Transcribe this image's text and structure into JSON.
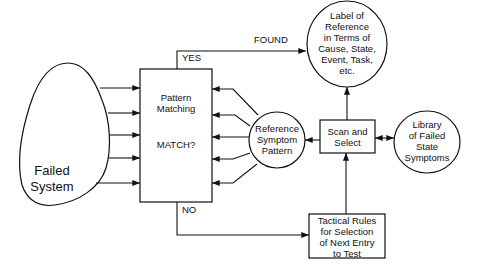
{
  "diagram": {
    "nodes": {
      "failed_system": {
        "label": "Failed\nSystem",
        "shape": "blob"
      },
      "pattern_matching": {
        "title": "Pattern\nMatching",
        "question": "MATCH?",
        "shape": "rectangle"
      },
      "label_of_reference": {
        "label": "Label of\nReference\nin Terms of\nCause, State,\nEvent, Task,\netc.",
        "shape": "circle"
      },
      "reference_symptom_pattern": {
        "label": "Reference\nSymptom\nPattern",
        "shape": "circle"
      },
      "scan_and_select": {
        "label": "Scan and\nSelect",
        "shape": "rectangle"
      },
      "library": {
        "label": "Library\nof Failed\nState\nSymptoms",
        "shape": "circle"
      },
      "tactical_rules": {
        "label": "Tactical Rules\nfor Selection\nof Next Entry\nto Test",
        "shape": "rectangle"
      }
    },
    "edges": {
      "yes": {
        "label": "YES",
        "from": "pattern_matching",
        "to": "label_of_reference"
      },
      "found": {
        "label": "FOUND"
      },
      "no": {
        "label": "NO",
        "from": "pattern_matching",
        "to": "tactical_rules"
      },
      "failed_to_matching": {
        "count": 5
      },
      "reference_to_matching": {
        "count": 5
      },
      "scan_to_reference": {},
      "scan_to_label": {},
      "scan_library": {
        "bidirectional": true
      },
      "tactical_to_scan": {}
    },
    "colors": {
      "stroke": "#111111",
      "background": "#ffffff"
    }
  }
}
